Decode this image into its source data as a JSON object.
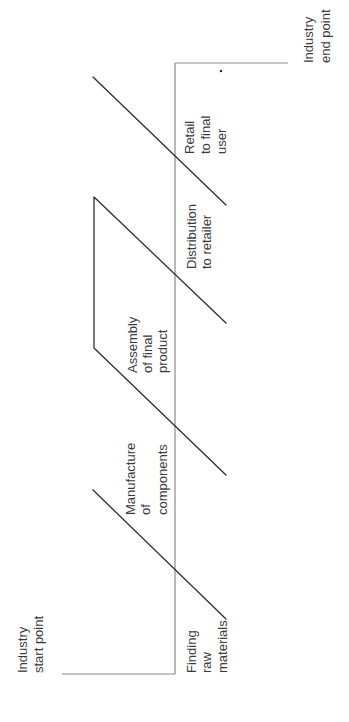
{
  "diagram": {
    "title": "",
    "orientation": "rotated-90-ccw",
    "endpoints": {
      "start": [
        "Industry",
        "start point"
      ],
      "end": [
        "Industry",
        "end point"
      ]
    },
    "stages": [
      {
        "id": "finding-raw-materials",
        "lines": [
          "Finding",
          "raw",
          "materials"
        ]
      },
      {
        "id": "manufacture-of-components",
        "lines": [
          "Manufacture",
          "of",
          "components"
        ]
      },
      {
        "id": "assembly-of-final-product",
        "lines": [
          "Assembly",
          "of final",
          "product"
        ]
      },
      {
        "id": "distribution-to-retailer",
        "lines": [
          "Distribution",
          "to retailer"
        ]
      },
      {
        "id": "retail-to-final-user",
        "lines": [
          "Retail",
          "to final",
          "user"
        ]
      }
    ],
    "colors": {
      "axis": "#8a8a8a",
      "stage_lines": "#2e2e2e",
      "text": "#3a3a3a",
      "background": "#ffffff"
    }
  }
}
